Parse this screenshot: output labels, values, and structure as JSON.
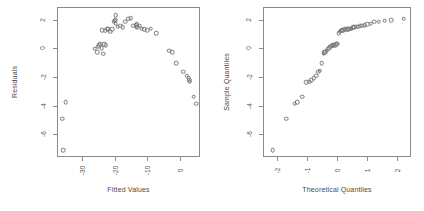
{
  "figure": {
    "title": "",
    "background": "#ffffff",
    "point_color": "#777777",
    "axis_color": "#8a8a8a",
    "text_color": "#4a4a4a",
    "panels": 2
  },
  "chart_data": [
    {
      "type": "scatter",
      "id": "residuals-vs-fitted",
      "title": "",
      "xlabel": "Fitted Values",
      "ylabel": "Residuals",
      "xlim": [
        -37.5,
        6.0
      ],
      "ylim": [
        -7.6,
        2.9
      ],
      "xticks": [
        -30,
        -20,
        -10,
        0
      ],
      "xticklabels": [
        "-30",
        "-20",
        "-10",
        "0"
      ],
      "yticks": [
        2,
        0,
        -2,
        -4,
        -6
      ],
      "yticklabels": [
        "2",
        "0",
        "-2",
        "-4",
        "-6"
      ],
      "grid": false,
      "legend": null,
      "marker": "open-circle",
      "x": [
        -36.2,
        -35.1,
        -36.0,
        -26.3,
        -25.6,
        -25.2,
        -24.9,
        -24.6,
        -24.2,
        -23.8,
        -23.4,
        -23.0,
        -24.0,
        -23.2,
        -22.6,
        -22.2,
        -21.6,
        -21.1,
        -20.6,
        -20.2,
        -20.1,
        -20.0,
        -19.9,
        -19.3,
        -18.6,
        -17.8,
        -17.0,
        -16.2,
        -15.4,
        -14.6,
        -13.8,
        -13.6,
        -13.5,
        -13.4,
        -12.6,
        -12.0,
        -11.2,
        -10.4,
        -9.3,
        -7.6,
        -3.6,
        -2.7,
        -1.6,
        0.6,
        1.6,
        2.2,
        2.5,
        2.6,
        3.8,
        4.6
      ],
      "y": [
        -4.85,
        -3.7,
        -7.05,
        0.05,
        -0.2,
        0.2,
        0.3,
        0.4,
        0.1,
        -0.3,
        0.35,
        0.3,
        1.35,
        1.3,
        1.45,
        1.4,
        1.25,
        1.4,
        1.95,
        2.0,
        2.05,
        1.8,
        2.4,
        1.6,
        1.65,
        1.55,
        1.95,
        2.15,
        2.2,
        1.65,
        1.7,
        1.75,
        1.6,
        1.55,
        1.65,
        1.45,
        1.4,
        1.35,
        1.45,
        1.15,
        -0.1,
        -0.2,
        -0.95,
        -1.55,
        -1.85,
        -2.0,
        -2.15,
        -2.25,
        -3.3,
        -3.8
      ]
    },
    {
      "type": "scatter",
      "id": "normal-qq",
      "title": "",
      "xlabel": "Theoretical Quantiles",
      "ylabel": "Sample Quantiles",
      "xlim": [
        -2.45,
        2.45
      ],
      "ylim": [
        -7.6,
        2.9
      ],
      "xticks": [
        -2,
        -1,
        0,
        1,
        2
      ],
      "xticklabels": [
        "-2",
        "-1",
        "0",
        "1",
        "2"
      ],
      "yticks": [
        2,
        0,
        -2,
        -4,
        -6
      ],
      "yticklabels": [
        "2",
        "0",
        "-2",
        "-4",
        "-6"
      ],
      "grid": false,
      "legend": null,
      "marker": "open-circle",
      "x": [
        -2.16,
        -1.72,
        -1.44,
        -1.35,
        -1.18,
        -1.05,
        -0.95,
        -0.88,
        -0.8,
        -0.73,
        -0.66,
        -0.6,
        -0.54,
        -0.48,
        -0.46,
        -0.42,
        -0.38,
        -0.34,
        -0.3,
        -0.26,
        -0.22,
        -0.18,
        -0.14,
        -0.1,
        -0.06,
        -0.02,
        0.02,
        0.06,
        0.1,
        0.14,
        0.18,
        0.24,
        0.3,
        0.34,
        0.38,
        0.42,
        0.46,
        0.5,
        0.54,
        0.6,
        0.66,
        0.73,
        0.8,
        0.88,
        0.97,
        1.08,
        1.2,
        1.35,
        1.55,
        1.76,
        2.18
      ],
      "y": [
        -7.05,
        -4.85,
        -3.8,
        -3.7,
        -3.3,
        -2.3,
        -2.25,
        -2.15,
        -2.0,
        -1.85,
        -1.55,
        -1.5,
        -0.95,
        -0.3,
        -0.2,
        -0.2,
        -0.1,
        0.05,
        0.1,
        0.2,
        0.25,
        0.3,
        0.3,
        0.3,
        0.35,
        0.4,
        1.15,
        1.25,
        1.3,
        1.35,
        1.35,
        1.4,
        1.4,
        1.4,
        1.45,
        1.45,
        1.45,
        1.55,
        1.55,
        1.6,
        1.6,
        1.65,
        1.65,
        1.7,
        1.75,
        1.8,
        1.95,
        1.95,
        2.0,
        2.05,
        2.15
      ]
    }
  ]
}
